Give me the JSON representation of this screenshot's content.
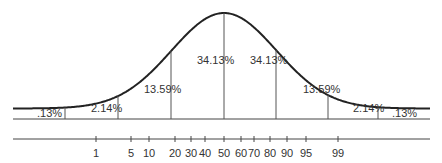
{
  "diagram": {
    "type": "normal-distribution",
    "segments": [
      {
        "label": ".13%",
        "x": 37,
        "y": 117
      },
      {
        "label": "2.14%",
        "x": 91,
        "y": 112
      },
      {
        "label": "13.59%",
        "x": 144,
        "y": 93
      },
      {
        "label": "34.13%",
        "x": 197,
        "y": 64
      },
      {
        "label": "34.13%",
        "x": 250,
        "y": 64
      },
      {
        "label": "13.59%",
        "x": 303,
        "y": 93
      },
      {
        "label": "2.14%",
        "x": 353,
        "y": 112
      },
      {
        "label": ".13%",
        "x": 392,
        "y": 117
      }
    ],
    "percentile_scale": {
      "ticks": [
        {
          "label": "1",
          "x": 96
        },
        {
          "label": "5",
          "x": 131
        },
        {
          "label": "10",
          "x": 149
        },
        {
          "label": "20",
          "x": 175
        },
        {
          "label": "30",
          "x": 191
        },
        {
          "label": "40",
          "x": 205
        },
        {
          "label": "50",
          "x": 224
        },
        {
          "label": "60",
          "x": 241
        },
        {
          "label": "70",
          "x": 254
        },
        {
          "label": "80",
          "x": 270
        },
        {
          "label": "90",
          "x": 287
        },
        {
          "label": "95",
          "x": 306
        },
        {
          "label": "99",
          "x": 338
        }
      ]
    },
    "colors": {
      "line": "#222222",
      "divider": "#555555",
      "text": "#333333"
    }
  }
}
